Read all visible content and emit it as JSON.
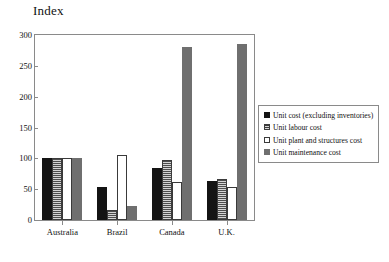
{
  "chart_data": {
    "type": "bar",
    "title": "",
    "xlabel": "",
    "ylabel": "Index",
    "ylim": [
      0,
      300
    ],
    "yticks": [
      0,
      50,
      100,
      150,
      200,
      250,
      300
    ],
    "grid": false,
    "legend_position": "right-outside",
    "categories": [
      "Australia",
      "Brazil",
      "Canada",
      "U.K."
    ],
    "series": [
      {
        "name": "Unit cost (excluding inventories)",
        "fill": "solid-black",
        "color": "#141414",
        "values": [
          100,
          53,
          85,
          64
        ]
      },
      {
        "name": "Unit labour cost",
        "fill": "horizontal-stripes",
        "color": "#9a9a9a",
        "values": [
          100,
          17,
          97,
          66
        ]
      },
      {
        "name": "Unit plant and structures cost",
        "fill": "white-outline",
        "color": "#ffffff",
        "values": [
          100,
          105,
          62,
          53
        ]
      },
      {
        "name": "Unit maintenance cost",
        "fill": "solid-gray",
        "color": "#6f6f6f",
        "values": [
          100,
          22,
          281,
          285
        ]
      }
    ]
  }
}
